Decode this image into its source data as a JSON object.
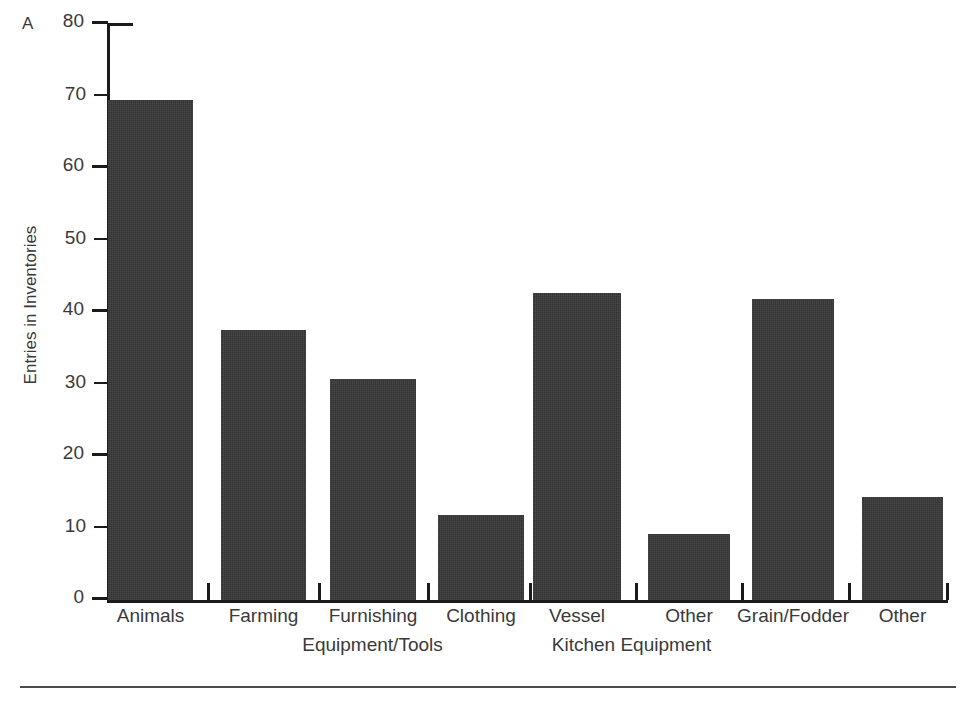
{
  "panel": {
    "letter": "A"
  },
  "chart_data": {
    "type": "bar",
    "title": "",
    "xlabel": "",
    "ylabel": "Entries in Inventories",
    "ylim": [
      0,
      80
    ],
    "yticks": [
      0,
      10,
      20,
      30,
      40,
      50,
      60,
      70,
      80
    ],
    "ytick_labels": [
      "0",
      "10",
      "20",
      "30",
      "40",
      "50",
      "60",
      "70",
      "80"
    ],
    "grid": false,
    "legend": "none",
    "categories": [
      "Animals",
      "Farming",
      "Furnishing",
      "Clothing",
      "Vessel",
      "Other",
      "Grain/Fodder",
      "Other"
    ],
    "values": [
      69.5,
      37.5,
      30.7,
      11.8,
      42.6,
      9.2,
      41.8,
      14.3
    ],
    "group_labels": [
      {
        "label": "Equipment/Tools",
        "covers": [
          "Farming",
          "Furnishing",
          "Clothing"
        ]
      },
      {
        "label": "Kitchen Equipment",
        "covers": [
          "Vessel",
          "Other"
        ]
      }
    ],
    "bar_color": "#343434",
    "axis_color": "#1b1b1b",
    "text_color": "#3a3a3a",
    "background": "#ffffff"
  }
}
